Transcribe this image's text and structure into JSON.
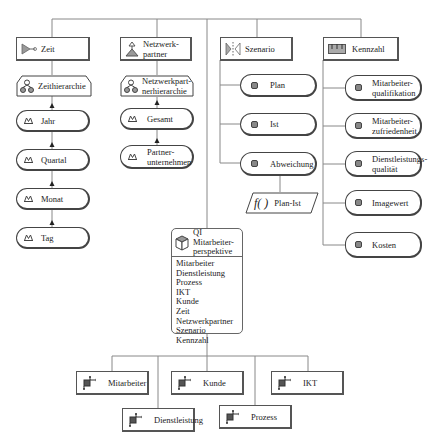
{
  "diagram": {
    "type": "multidimensional-data-model",
    "dimensions": [
      {
        "id": "zeit",
        "label": "Zeit",
        "icon": "dimension-icon",
        "hierarchy": {
          "label": "Zeithierarchie",
          "icon": "hierarchy-icon"
        },
        "levels": [
          "Jahr",
          "Quartal",
          "Monat",
          "Tag"
        ]
      },
      {
        "id": "netzwerkpartner",
        "label": "Netzwerk-\npartner",
        "label_lines": [
          "Netzwerk-",
          "partner"
        ],
        "icon": "network-partner-icon",
        "hierarchy": {
          "label_lines": [
            "Netzwerkpart-",
            "nerhierarchie"
          ],
          "icon": "hierarchy-icon"
        },
        "levels": [
          {
            "lines": [
              "Gesamt"
            ]
          },
          {
            "lines": [
              "Partner-",
              "unternehmen"
            ]
          }
        ]
      },
      {
        "id": "szenario",
        "label": "Szenario",
        "icon": "scenario-icon",
        "elements": [
          "Plan",
          "Ist",
          "Abweichung"
        ],
        "formula": {
          "label": "Plan-Ist",
          "icon": "function-icon",
          "symbol": "f( )"
        }
      },
      {
        "id": "kennzahl",
        "label": "Kennzahl",
        "icon": "measure-icon",
        "elements": [
          {
            "lines": [
              "Mitarbeiter-",
              "qualifikation"
            ]
          },
          {
            "lines": [
              "Mitarbeiter-",
              "zufriedenheit"
            ]
          },
          {
            "lines": [
              "Dienstleistungs-",
              "qualität"
            ]
          },
          {
            "lines": [
              "Imagewert"
            ]
          },
          {
            "lines": [
              "Kosten"
            ]
          }
        ]
      }
    ],
    "cube": {
      "title_lines": [
        "QI Mitarbeiter-",
        "perspektive"
      ],
      "icon": "cube-icon",
      "dimensions_list": [
        "Mitarbeiter",
        "Dienstleistung",
        "Prozess",
        "IKT",
        "Kunde",
        "Zeit",
        "Netzwerkpartner",
        "Szenario",
        "Kennzahl"
      ]
    },
    "fact_dimensions": [
      {
        "label": "Mitarbeiter"
      },
      {
        "label": "Kunde"
      },
      {
        "label": "IKT"
      },
      {
        "label": "Dienstleistung"
      },
      {
        "label": "Prozess"
      }
    ],
    "colors": {
      "line": "#777777",
      "border": "#444444",
      "icon_fill": "#8a8a8a",
      "background": "#ffffff"
    }
  }
}
